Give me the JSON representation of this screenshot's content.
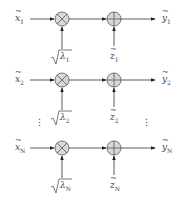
{
  "diagram": {
    "type": "parallel-channel-block-diagram",
    "rows": [
      {
        "input": "x",
        "input_sub": "1",
        "gain": "λ",
        "gain_sub": "1",
        "noise": "z",
        "noise_sub": "1",
        "output": "y",
        "output_sub": "1",
        "y": 19
      },
      {
        "input": "x",
        "input_sub": "2",
        "gain": "λ",
        "gain_sub": "2",
        "noise": "z",
        "noise_sub": "2",
        "output": "y",
        "output_sub": "2",
        "y": 80
      },
      {
        "input": "x",
        "input_sub": "N",
        "gain": "λ",
        "gain_sub": "N",
        "noise": "z",
        "noise_sub": "N",
        "output": "y",
        "output_sub": "N",
        "y": 148
      }
    ],
    "multiplier_symbol": "⊗",
    "adder_symbol": "⊕",
    "ellipsis": "⋮",
    "colors": {
      "line": "#333333",
      "node_fill": "#d8d8d8",
      "text": "#444444"
    }
  }
}
